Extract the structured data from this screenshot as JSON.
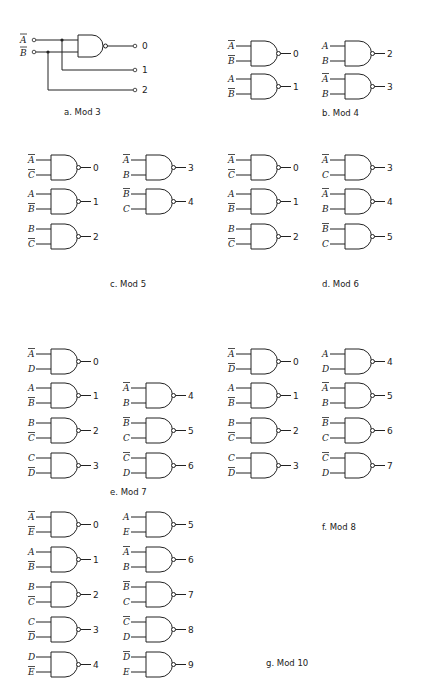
{
  "figures": [
    {
      "id": "a",
      "caption": "a. Mod 3",
      "inputs": [
        {
          "name": "A",
          "bar": true
        },
        {
          "name": "B",
          "bar": true
        }
      ],
      "outputs": [
        "0",
        "1",
        "2"
      ]
    },
    {
      "id": "b",
      "caption": "b. Mod 4",
      "gates": [
        {
          "in": [
            {
              "n": "A",
              "bar": true
            },
            {
              "n": "B",
              "bar": true
            }
          ],
          "out": "0"
        },
        {
          "in": [
            {
              "n": "A",
              "bar": false
            },
            {
              "n": "B",
              "bar": true
            }
          ],
          "out": "1"
        },
        {
          "in": [
            {
              "n": "A",
              "bar": false
            },
            {
              "n": "B",
              "bar": false
            }
          ],
          "out": "2"
        },
        {
          "in": [
            {
              "n": "A",
              "bar": true
            },
            {
              "n": "B",
              "bar": false
            }
          ],
          "out": "3"
        }
      ]
    },
    {
      "id": "c",
      "caption": "c. Mod 5",
      "gates": [
        {
          "in": [
            {
              "n": "A",
              "bar": true
            },
            {
              "n": "C",
              "bar": true
            }
          ],
          "out": "0"
        },
        {
          "in": [
            {
              "n": "A",
              "bar": false
            },
            {
              "n": "B",
              "bar": true
            }
          ],
          "out": "1"
        },
        {
          "in": [
            {
              "n": "B",
              "bar": false
            },
            {
              "n": "C",
              "bar": true
            }
          ],
          "out": "2"
        },
        {
          "in": [
            {
              "n": "A",
              "bar": true
            },
            {
              "n": "B",
              "bar": false
            }
          ],
          "out": "3"
        },
        {
          "in": [
            {
              "n": "B",
              "bar": true
            },
            {
              "n": "C",
              "bar": false
            }
          ],
          "out": "4"
        }
      ]
    },
    {
      "id": "d",
      "caption": "d. Mod 6",
      "gates": [
        {
          "in": [
            {
              "n": "A",
              "bar": true
            },
            {
              "n": "C",
              "bar": true
            }
          ],
          "out": "0"
        },
        {
          "in": [
            {
              "n": "A",
              "bar": false
            },
            {
              "n": "B",
              "bar": true
            }
          ],
          "out": "1"
        },
        {
          "in": [
            {
              "n": "B",
              "bar": false
            },
            {
              "n": "C",
              "bar": true
            }
          ],
          "out": "2"
        },
        {
          "in": [
            {
              "n": "A",
              "bar": true
            },
            {
              "n": "C",
              "bar": false
            }
          ],
          "out": "3"
        },
        {
          "in": [
            {
              "n": "A",
              "bar": true
            },
            {
              "n": "B",
              "bar": false
            }
          ],
          "out": "4"
        },
        {
          "in": [
            {
              "n": "B",
              "bar": true
            },
            {
              "n": "C",
              "bar": false
            }
          ],
          "out": "5"
        }
      ]
    },
    {
      "id": "e",
      "caption": "e. Mod 7",
      "gates": [
        {
          "in": [
            {
              "n": "A",
              "bar": true
            },
            {
              "n": "D",
              "bar": false
            }
          ],
          "out": "0"
        },
        {
          "in": [
            {
              "n": "A",
              "bar": false
            },
            {
              "n": "B",
              "bar": true
            }
          ],
          "out": "1"
        },
        {
          "in": [
            {
              "n": "B",
              "bar": false
            },
            {
              "n": "C",
              "bar": true
            }
          ],
          "out": "2"
        },
        {
          "in": [
            {
              "n": "C",
              "bar": false
            },
            {
              "n": "D",
              "bar": true
            }
          ],
          "out": "3"
        },
        {
          "in": [
            {
              "n": "A",
              "bar": true
            },
            {
              "n": "B",
              "bar": false
            }
          ],
          "out": "4"
        },
        {
          "in": [
            {
              "n": "B",
              "bar": true
            },
            {
              "n": "C",
              "bar": false
            }
          ],
          "out": "5"
        },
        {
          "in": [
            {
              "n": "C",
              "bar": true
            },
            {
              "n": "D",
              "bar": false
            }
          ],
          "out": "6"
        }
      ]
    },
    {
      "id": "f",
      "caption": "f. Mod 8",
      "gates": [
        {
          "in": [
            {
              "n": "A",
              "bar": true
            },
            {
              "n": "D",
              "bar": true
            }
          ],
          "out": "0"
        },
        {
          "in": [
            {
              "n": "A",
              "bar": false
            },
            {
              "n": "B",
              "bar": true
            }
          ],
          "out": "1"
        },
        {
          "in": [
            {
              "n": "B",
              "bar": false
            },
            {
              "n": "C",
              "bar": true
            }
          ],
          "out": "2"
        },
        {
          "in": [
            {
              "n": "C",
              "bar": false
            },
            {
              "n": "D",
              "bar": true
            }
          ],
          "out": "3"
        },
        {
          "in": [
            {
              "n": "A",
              "bar": false
            },
            {
              "n": "D",
              "bar": false
            }
          ],
          "out": "4"
        },
        {
          "in": [
            {
              "n": "A",
              "bar": true
            },
            {
              "n": "B",
              "bar": false
            }
          ],
          "out": "5"
        },
        {
          "in": [
            {
              "n": "B",
              "bar": true
            },
            {
              "n": "C",
              "bar": false
            }
          ],
          "out": "6"
        },
        {
          "in": [
            {
              "n": "C",
              "bar": true
            },
            {
              "n": "D",
              "bar": false
            }
          ],
          "out": "7"
        }
      ]
    },
    {
      "id": "g",
      "caption": "g. Mod 10",
      "gates": [
        {
          "in": [
            {
              "n": "A",
              "bar": true
            },
            {
              "n": "E",
              "bar": true
            }
          ],
          "out": "0"
        },
        {
          "in": [
            {
              "n": "A",
              "bar": false
            },
            {
              "n": "B",
              "bar": true
            }
          ],
          "out": "1"
        },
        {
          "in": [
            {
              "n": "B",
              "bar": false
            },
            {
              "n": "C",
              "bar": true
            }
          ],
          "out": "2"
        },
        {
          "in": [
            {
              "n": "C",
              "bar": false
            },
            {
              "n": "D",
              "bar": true
            }
          ],
          "out": "3"
        },
        {
          "in": [
            {
              "n": "D",
              "bar": false
            },
            {
              "n": "E",
              "bar": true
            }
          ],
          "out": "4"
        },
        {
          "in": [
            {
              "n": "A",
              "bar": false
            },
            {
              "n": "E",
              "bar": false
            }
          ],
          "out": "5"
        },
        {
          "in": [
            {
              "n": "A",
              "bar": true
            },
            {
              "n": "B",
              "bar": false
            }
          ],
          "out": "6"
        },
        {
          "in": [
            {
              "n": "B",
              "bar": true
            },
            {
              "n": "C",
              "bar": false
            }
          ],
          "out": "7"
        },
        {
          "in": [
            {
              "n": "C",
              "bar": true
            },
            {
              "n": "D",
              "bar": false
            }
          ],
          "out": "8"
        },
        {
          "in": [
            {
              "n": "D",
              "bar": true
            },
            {
              "n": "E",
              "bar": false
            }
          ],
          "out": "9"
        }
      ]
    }
  ],
  "layout": {
    "b": {
      "positions": [
        [
          251,
          46
        ],
        [
          251,
          79
        ],
        [
          345,
          46
        ],
        [
          345,
          79
        ]
      ],
      "caption_pos": [
        322,
        116
      ]
    },
    "c": {
      "positions": [
        [
          51,
          160
        ],
        [
          51,
          194
        ],
        [
          51,
          229
        ],
        [
          146,
          160
        ],
        [
          146,
          194
        ]
      ],
      "caption_pos": [
        110,
        287
      ]
    },
    "d": {
      "positions": [
        [
          251,
          160
        ],
        [
          251,
          194
        ],
        [
          251,
          229
        ],
        [
          345,
          160
        ],
        [
          345,
          194
        ],
        [
          345,
          229
        ]
      ],
      "caption_pos": [
        322,
        287
      ]
    },
    "e": {
      "positions": [
        [
          51,
          354
        ],
        [
          51,
          388
        ],
        [
          51,
          423
        ],
        [
          51,
          458
        ],
        [
          146,
          388
        ],
        [
          146,
          423
        ],
        [
          146,
          458
        ]
      ],
      "caption_pos": [
        110,
        495
      ]
    },
    "f": {
      "positions": [
        [
          251,
          354
        ],
        [
          251,
          388
        ],
        [
          251,
          423
        ],
        [
          251,
          458
        ],
        [
          345,
          354
        ],
        [
          345,
          388
        ],
        [
          345,
          423
        ],
        [
          345,
          458
        ]
      ],
      "caption_pos": [
        322,
        530
      ]
    },
    "g": {
      "positions": [
        [
          51,
          517
        ],
        [
          51,
          552
        ],
        [
          51,
          587
        ],
        [
          51,
          622
        ],
        [
          51,
          657
        ],
        [
          146,
          517
        ],
        [
          146,
          552
        ],
        [
          146,
          587
        ],
        [
          146,
          622
        ],
        [
          146,
          657
        ]
      ],
      "caption_pos": [
        266,
        666
      ]
    }
  }
}
